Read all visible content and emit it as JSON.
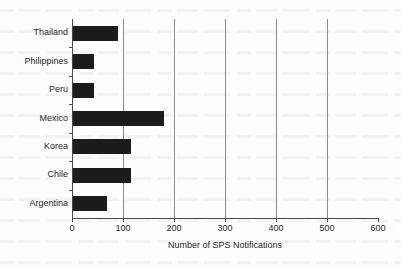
{
  "chart_data": {
    "type": "bar",
    "orientation": "horizontal",
    "title": "",
    "xlabel": "Number of SPS Notifications",
    "ylabel": "",
    "categories": [
      "Thailand",
      "Philippines",
      "Peru",
      "Mexico",
      "Korea",
      "Chile",
      "Argentina"
    ],
    "values": [
      88,
      41,
      41,
      178,
      114,
      113,
      67
    ],
    "xlim": [
      0,
      600
    ],
    "xticks": [
      0,
      100,
      200,
      300,
      400,
      500,
      600
    ],
    "xtick_labels": [
      "0",
      "100",
      "200",
      "300",
      "400",
      "500",
      "600"
    ],
    "gridlines": [
      100,
      200,
      300,
      400,
      500
    ],
    "grid": true,
    "legend": false,
    "bar_color": "#1c1c1c",
    "axis_color": "#4a4a4a",
    "gridline_color": "#8b8b8b",
    "background_color": "#ffffff"
  }
}
